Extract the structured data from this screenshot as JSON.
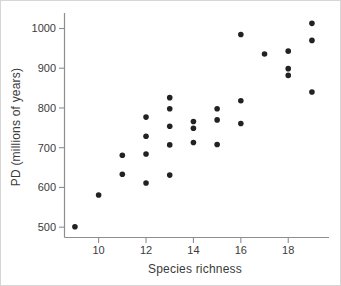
{
  "figure": {
    "background": "#ffffff",
    "border_color": "#d6d6d6"
  },
  "chart_data": {
    "type": "scatter",
    "title": "",
    "xlabel": "Species richness",
    "ylabel": "PD (millions of years)",
    "xlim": [
      8.56,
      19.72
    ],
    "ylim": [
      474,
      1039
    ],
    "x_ticks": [
      10,
      12,
      14,
      16,
      18
    ],
    "y_ticks": [
      500,
      600,
      700,
      800,
      900,
      1000
    ],
    "grid": false,
    "legend": false,
    "axis_color": "#8e8e8e",
    "label_color": "#3b3b3b",
    "marker": {
      "shape": "circle",
      "color": "#222222",
      "radius_px": 2.8
    },
    "points": [
      [
        9,
        501
      ],
      [
        10,
        581
      ],
      [
        11,
        633
      ],
      [
        11,
        681
      ],
      [
        12,
        611
      ],
      [
        12,
        684
      ],
      [
        12,
        729
      ],
      [
        12,
        777
      ],
      [
        13,
        631
      ],
      [
        13,
        707
      ],
      [
        13,
        754
      ],
      [
        13,
        798
      ],
      [
        13,
        826
      ],
      [
        14,
        713
      ],
      [
        14,
        749
      ],
      [
        14,
        766
      ],
      [
        15,
        708
      ],
      [
        15,
        770
      ],
      [
        15,
        798
      ],
      [
        16,
        761
      ],
      [
        16,
        818
      ],
      [
        16,
        985
      ],
      [
        17,
        936
      ],
      [
        18,
        882
      ],
      [
        18,
        899
      ],
      [
        18,
        943
      ],
      [
        19,
        840
      ],
      [
        19,
        970
      ],
      [
        19,
        1013
      ]
    ]
  }
}
